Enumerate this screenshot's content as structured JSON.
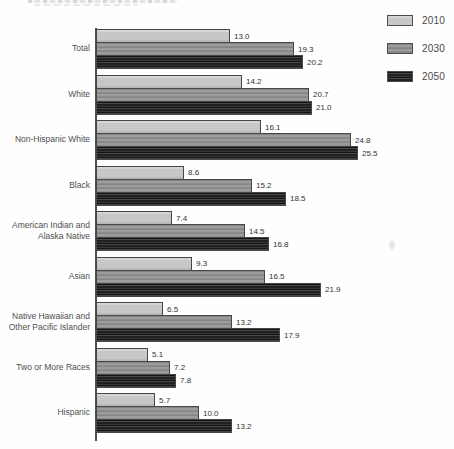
{
  "figure": {
    "background_color": "#fefefe",
    "axis_color": "#4f4f4f",
    "note": "scanned horizontal grouped bar chart, title cropped off at top edge"
  },
  "legend": {
    "position": "top-right",
    "items": [
      {
        "label": "2010",
        "color": "#c7c7c7"
      },
      {
        "label": "2030",
        "color": "#949494"
      },
      {
        "label": "2050",
        "color": "#2b2b2b"
      }
    ]
  },
  "chart_data": {
    "type": "bar",
    "orientation": "horizontal",
    "title": "",
    "xlabel": "",
    "ylabel": "",
    "xlim": [
      0,
      26
    ],
    "grid": false,
    "legend_position": "top-right",
    "value_labels": "one decimal, right of each bar",
    "categories": [
      "Total",
      "White",
      "Non-Hispanic White",
      "Black",
      "American Indian and\nAlaska Native",
      "Asian",
      "Native Hawaiian and\nOther Pacific Islander",
      "Two or More Races",
      "Hispanic"
    ],
    "series": [
      {
        "name": "2010",
        "color": "#c7c7c7",
        "values": [
          13.0,
          14.2,
          16.1,
          8.6,
          7.4,
          9.3,
          6.5,
          5.1,
          5.7
        ]
      },
      {
        "name": "2030",
        "color": "#949494",
        "values": [
          19.3,
          20.7,
          24.8,
          15.2,
          14.5,
          16.5,
          13.2,
          7.2,
          10.0
        ]
      },
      {
        "name": "2050",
        "color": "#2b2b2b",
        "values": [
          20.2,
          21.0,
          25.5,
          18.5,
          16.8,
          21.9,
          17.9,
          7.8,
          13.2
        ]
      }
    ]
  }
}
